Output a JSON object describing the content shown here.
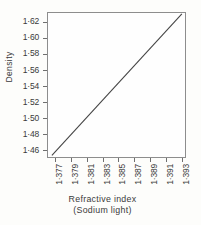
{
  "chart_data": {
    "type": "line",
    "title": "",
    "xlabel": "Refractive index",
    "xlabel_sub": "(Sodium light)",
    "ylabel": "Density",
    "xlim": [
      1.376,
      1.3935
    ],
    "ylim": [
      1.45,
      1.632
    ],
    "grid": false,
    "legend": null,
    "x_tick_labels": [
      "1·377",
      "1·379",
      "1·381",
      "1·383",
      "1·385",
      "1·387",
      "1·389",
      "1·391",
      "1·393"
    ],
    "x_tick_values": [
      1.377,
      1.379,
      1.381,
      1.383,
      1.385,
      1.387,
      1.389,
      1.391,
      1.393
    ],
    "y_tick_labels": [
      "1·62",
      "1·60",
      "1·58",
      "1·56",
      "1·54",
      "1·52",
      "1·50",
      "1·48",
      "1·46"
    ],
    "y_tick_values": [
      1.62,
      1.6,
      1.58,
      1.56,
      1.54,
      1.52,
      1.5,
      1.48,
      1.46
    ],
    "series": [
      {
        "name": "Density vs refractive index",
        "x": [
          1.3765,
          1.3931
        ],
        "y": [
          1.452,
          1.631
        ],
        "color": "#444444"
      }
    ],
    "colors": {
      "ink": "#3a3a3a",
      "line": "#444444",
      "frame": "#8d8d8d",
      "paper": "#fdfdfb",
      "plot_background": "#fefefe"
    }
  }
}
